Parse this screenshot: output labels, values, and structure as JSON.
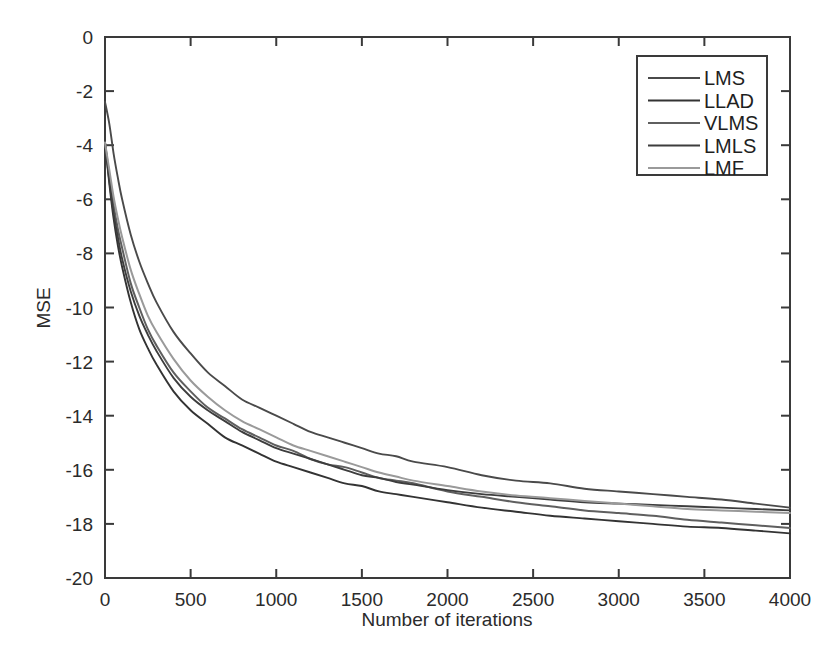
{
  "figure": {
    "background_color": "#ffffff",
    "axis_color": "#3a3a3a",
    "text_color": "#2b2b2b"
  },
  "chart_data": {
    "type": "line",
    "title": "",
    "xlabel": "Number of iterations",
    "ylabel": "MSE",
    "xlim": [
      0,
      4000
    ],
    "ylim": [
      -20,
      0
    ],
    "xticks": [
      0,
      500,
      1000,
      1500,
      2000,
      2500,
      3000,
      3500,
      4000
    ],
    "yticks": [
      0,
      -2,
      -4,
      -6,
      -8,
      -10,
      -12,
      -14,
      -16,
      -18,
      -20
    ],
    "xticklabels": [
      "0",
      "500",
      "1000",
      "1500",
      "2000",
      "2500",
      "3000",
      "3500",
      "4000"
    ],
    "yticklabels": [
      "0",
      "-2",
      "-4",
      "-6",
      "-8",
      "-10",
      "-12",
      "-14",
      "-16",
      "-18",
      "-20"
    ],
    "grid": false,
    "legend_position": "upper right",
    "x": [
      0,
      25,
      50,
      75,
      100,
      150,
      200,
      250,
      300,
      400,
      500,
      600,
      700,
      800,
      900,
      1000,
      1100,
      1200,
      1300,
      1400,
      1500,
      1600,
      1700,
      1800,
      2000,
      2200,
      2400,
      2600,
      2800,
      3000,
      3200,
      3400,
      3600,
      3800,
      4000
    ],
    "series": [
      {
        "name": "LMS",
        "color": "#4a4a4a",
        "values": [
          -2.4,
          -3.2,
          -4.3,
          -5.2,
          -6.0,
          -7.3,
          -8.3,
          -9.1,
          -9.8,
          -10.9,
          -11.7,
          -12.4,
          -12.9,
          -13.4,
          -13.7,
          -14.0,
          -14.3,
          -14.6,
          -14.8,
          -15.0,
          -15.2,
          -15.4,
          -15.5,
          -15.7,
          -15.9,
          -16.2,
          -16.4,
          -16.5,
          -16.7,
          -16.8,
          -16.9,
          -17.0,
          -17.1,
          -17.25,
          -17.4
        ]
      },
      {
        "name": "LLAD",
        "color": "#333333",
        "values": [
          -3.9,
          -5.4,
          -6.7,
          -7.7,
          -8.5,
          -9.8,
          -10.8,
          -11.5,
          -12.1,
          -13.1,
          -13.8,
          -14.3,
          -14.8,
          -15.1,
          -15.4,
          -15.7,
          -15.9,
          -16.1,
          -16.3,
          -16.5,
          -16.6,
          -16.8,
          -16.9,
          -17.0,
          -17.2,
          -17.4,
          -17.55,
          -17.7,
          -17.8,
          -17.9,
          -18.0,
          -18.1,
          -18.15,
          -18.25,
          -18.35
        ]
      },
      {
        "name": "VLMS",
        "color": "#5f5f5f",
        "values": [
          -3.9,
          -5.1,
          -6.2,
          -7.1,
          -7.8,
          -9.1,
          -10.0,
          -10.8,
          -11.4,
          -12.4,
          -13.1,
          -13.7,
          -14.1,
          -14.5,
          -14.8,
          -15.1,
          -15.3,
          -15.6,
          -15.8,
          -15.9,
          -16.1,
          -16.3,
          -16.4,
          -16.5,
          -16.8,
          -17.0,
          -17.2,
          -17.35,
          -17.5,
          -17.6,
          -17.7,
          -17.85,
          -17.95,
          -18.05,
          -18.15
        ]
      },
      {
        "name": "LMLS",
        "color": "#3d3d3d",
        "values": [
          -3.9,
          -5.3,
          -6.5,
          -7.4,
          -8.2,
          -9.4,
          -10.3,
          -11.0,
          -11.6,
          -12.6,
          -13.3,
          -13.8,
          -14.2,
          -14.6,
          -14.9,
          -15.2,
          -15.4,
          -15.6,
          -15.8,
          -16.0,
          -16.2,
          -16.3,
          -16.45,
          -16.55,
          -16.75,
          -16.9,
          -17.0,
          -17.1,
          -17.2,
          -17.25,
          -17.3,
          -17.35,
          -17.4,
          -17.45,
          -17.5
        ]
      },
      {
        "name": "LMF",
        "color": "#9a9a9a",
        "values": [
          -3.9,
          -4.9,
          -5.9,
          -6.7,
          -7.4,
          -8.6,
          -9.5,
          -10.3,
          -10.9,
          -11.9,
          -12.7,
          -13.3,
          -13.8,
          -14.2,
          -14.5,
          -14.8,
          -15.1,
          -15.3,
          -15.5,
          -15.7,
          -15.9,
          -16.1,
          -16.25,
          -16.4,
          -16.6,
          -16.8,
          -16.95,
          -17.05,
          -17.15,
          -17.25,
          -17.35,
          -17.45,
          -17.5,
          -17.55,
          -17.6
        ]
      }
    ]
  },
  "legend": {
    "entries": [
      {
        "label": "LMS"
      },
      {
        "label": "LLAD"
      },
      {
        "label": "VLMS"
      },
      {
        "label": "LMLS"
      },
      {
        "label": "LMF"
      }
    ]
  }
}
